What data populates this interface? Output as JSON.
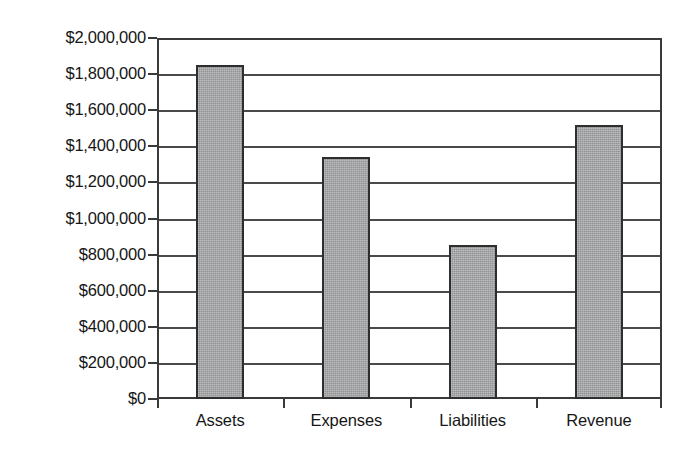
{
  "chart_data": {
    "type": "bar",
    "title": "",
    "subtitle": "",
    "xlabel": "",
    "ylabel": "",
    "categories": [
      "Assets",
      "Expenses",
      "Liabilities",
      "Revenue"
    ],
    "values": [
      1850000,
      1340000,
      855000,
      1520000
    ],
    "ylim": [
      0,
      2000000
    ],
    "ytick_step": 200000,
    "ytick_labels": [
      "$2,000,000",
      "$1,800,000",
      "$1,600,000",
      "$1,400,000",
      "$1,200,000",
      "$1,000,000",
      "$800,000",
      "$600,000",
      "$400,000",
      "$200,000",
      "$0"
    ],
    "ytick_values": [
      2000000,
      1800000,
      1600000,
      1400000,
      1200000,
      1000000,
      800000,
      600000,
      400000,
      200000,
      0
    ],
    "grid": true,
    "grid_axis": "y",
    "legend": false,
    "legend_position": "none",
    "data_labels": false,
    "colors": {
      "bar_fill": "#a0a2a4",
      "bar_border": "#2e2e2e",
      "gridline": "#4a4a4a",
      "axis": "#3a3a3a",
      "text": "#161616",
      "background": "#ffffff"
    }
  }
}
